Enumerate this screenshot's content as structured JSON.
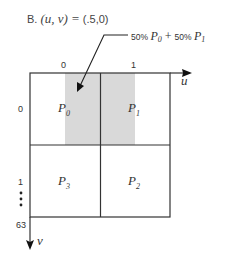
{
  "title": {
    "prefix": "B.",
    "expression_lhs": "(u, v)",
    "equals": "=",
    "expression_rhs": "(.5,0)"
  },
  "callout": {
    "weight_a": "50%",
    "var_a": "P",
    "var_a_sub": "0",
    "plus": "+",
    "weight_b": "50%",
    "var_b": "P",
    "var_b_sub": "1"
  },
  "axes": {
    "u": {
      "label": "u",
      "ticks": [
        "0",
        "1"
      ]
    },
    "v": {
      "label": "v",
      "ticks": [
        "0",
        "1",
        "63"
      ],
      "ellipsis": "⋮"
    }
  },
  "cells": [
    {
      "id": "P0",
      "base": "P",
      "sub": "0",
      "row": 0,
      "col": 0
    },
    {
      "id": "P1",
      "base": "P",
      "sub": "1",
      "row": 0,
      "col": 1
    },
    {
      "id": "P3",
      "base": "P",
      "sub": "3",
      "row": 1,
      "col": 0
    },
    {
      "id": "P2",
      "base": "P",
      "sub": "2",
      "row": 1,
      "col": 1
    }
  ],
  "colors": {
    "grid": "#333333",
    "shading": "#d9d9d9",
    "text": "#333333"
  }
}
